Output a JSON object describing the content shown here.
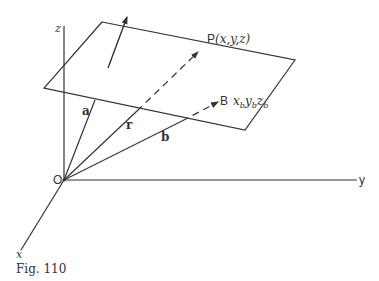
{
  "figure": {
    "caption": "Fig. 110",
    "origin_label": "O",
    "axes": {
      "x": "x",
      "y": "y",
      "z": "z"
    },
    "vectors": {
      "a": "a",
      "r": "r",
      "b": "b"
    },
    "points": {
      "P": {
        "name": "P",
        "coords": "(x,y,z)"
      },
      "B": {
        "name": "B",
        "coords_x": "x",
        "coords_y": "y",
        "coords_z": "z",
        "sub": "b"
      }
    },
    "colors": {
      "ink": "#333333",
      "background": "#ffffff"
    }
  }
}
